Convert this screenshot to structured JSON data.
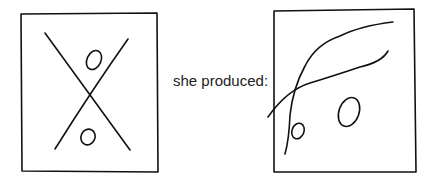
{
  "caption": "she produced:",
  "figures": [
    {
      "name": "original-drawing",
      "description": "Square containing an X with a small oval in the upper and lower triangles"
    },
    {
      "name": "produced-drawing",
      "description": "Square containing two curved crossing lines with a small oval and a larger oval in lower area"
    }
  ]
}
